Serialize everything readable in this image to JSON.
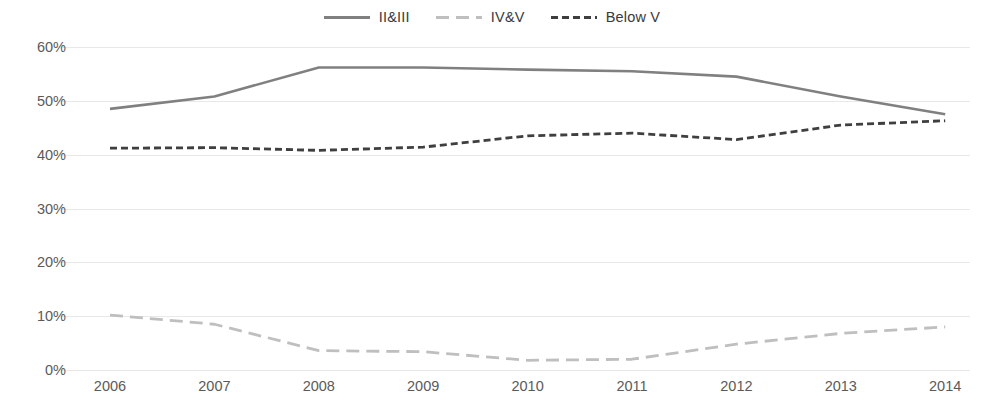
{
  "chart_data": {
    "type": "line",
    "title": "",
    "subtitle": "",
    "xlabel": "",
    "ylabel": "",
    "categories": [
      "2006",
      "2007",
      "2008",
      "2009",
      "2010",
      "2011",
      "2012",
      "2013",
      "2014"
    ],
    "x": [
      2006,
      2007,
      2008,
      2009,
      2010,
      2011,
      2012,
      2013,
      2014
    ],
    "ylim": [
      0,
      60
    ],
    "yticks": [
      0,
      10,
      20,
      30,
      40,
      50,
      60
    ],
    "ytick_labels": [
      "0%",
      "10%",
      "20%",
      "30%",
      "40%",
      "50%",
      "60%"
    ],
    "grid": true,
    "grid_axis": "y",
    "legend_position": "top-center",
    "value_format": "percent",
    "series": [
      {
        "name": "II&III",
        "values": [
          48.5,
          50.8,
          56.2,
          56.2,
          55.8,
          55.5,
          54.5,
          50.8,
          47.5
        ],
        "color": "#808080",
        "style": "solid",
        "width": 2.6
      },
      {
        "name": "IV&V",
        "values": [
          10.2,
          8.5,
          3.6,
          3.4,
          1.8,
          2.0,
          4.8,
          6.8,
          8.0
        ],
        "color": "#bfbfbf",
        "style": "dashed-long",
        "width": 2.8
      },
      {
        "name": "Below V",
        "values": [
          41.2,
          41.3,
          40.8,
          41.4,
          43.5,
          44.0,
          42.8,
          45.5,
          46.3
        ],
        "color": "#3f3f3f",
        "style": "dashed-short",
        "width": 2.8
      }
    ]
  },
  "legend": {
    "items": [
      {
        "label": "II&III"
      },
      {
        "label": "IV&V"
      },
      {
        "label": "Below V"
      }
    ]
  },
  "axes": {
    "y_labels": [
      "60%",
      "50%",
      "40%",
      "30%",
      "20%",
      "10%",
      "0%"
    ],
    "x_labels": [
      "2006",
      "2007",
      "2008",
      "2009",
      "2010",
      "2011",
      "2012",
      "2013",
      "2014"
    ]
  },
  "colors": {
    "series_1": "#808080",
    "series_2": "#bfbfbf",
    "series_3": "#3f3f3f",
    "gridline": "#e8e8e8",
    "axis_text": "#5a5a5a",
    "background": "#ffffff"
  }
}
